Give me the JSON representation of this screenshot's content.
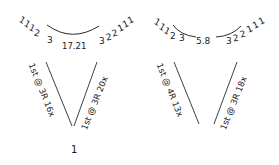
{
  "diagrams": [
    {
      "id": "left",
      "decrease_left": [
        "1",
        "1",
        "1",
        "2",
        "3"
      ],
      "center_value": "17.21",
      "decrease_right": [
        "3",
        "2",
        "2",
        "1",
        "1",
        "1"
      ],
      "left_arm_label": "1st @ 3R 16x",
      "right_arm_label": "1st @ 3R 20x",
      "bottom_value": "1"
    },
    {
      "id": "right",
      "decrease_left": [
        "1",
        "1",
        "1",
        "2",
        "3"
      ],
      "center_value": "5.8",
      "decrease_right": [
        "3",
        "2",
        "2",
        "1",
        "1",
        "1"
      ],
      "left_arm_label": "1st @ 4R 13x",
      "right_arm_label": "1st @ 3R 18x",
      "bottom_value": ""
    }
  ],
  "colors": {
    "ink": "#1a1a1a",
    "background": "#ffffff"
  }
}
